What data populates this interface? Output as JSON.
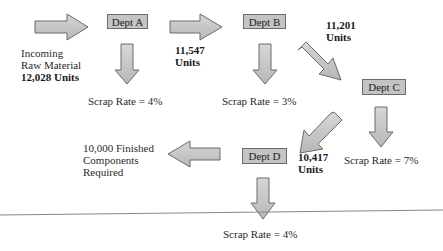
{
  "departments": [
    {
      "id": "A",
      "label": "Dept A",
      "scrap_rate": "Scrap Rate = 4%"
    },
    {
      "id": "B",
      "label": "Dept B",
      "scrap_rate": "Scrap Rate = 3%"
    },
    {
      "id": "C",
      "label": "Dept C",
      "scrap_rate": "Scrap Rate = 7%"
    },
    {
      "id": "D",
      "label": "Dept D",
      "scrap_rate": "Scrap Rate = 4%"
    }
  ],
  "input": {
    "line1": "Incoming",
    "line2": "Raw Material",
    "line3": "12,028 Units"
  },
  "flows": {
    "a_to_b": {
      "value": "11,547",
      "unit": "Units"
    },
    "b_to_c": {
      "value": "11,201",
      "unit": "Units"
    },
    "c_to_d": {
      "value": "10,417",
      "unit": "Units"
    }
  },
  "output": {
    "line1": "10,000 Finished",
    "line2": "Components",
    "line3": "Required"
  },
  "colors": {
    "box_fill": "#c4c4c4",
    "arrow_fill": "#c8c8c8",
    "arrow_stroke": "#6a6a6a"
  }
}
